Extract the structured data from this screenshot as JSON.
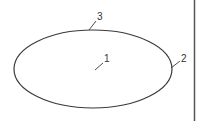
{
  "diagram": {
    "shape": "ellipse",
    "stroke_color": "#3a3a3a",
    "border_line_color": "#555555",
    "labels": [
      {
        "id": "1",
        "text": "1",
        "refers_to": "interior"
      },
      {
        "id": "2",
        "text": "2",
        "refers_to": "right edge"
      },
      {
        "id": "3",
        "text": "3",
        "refers_to": "top edge"
      }
    ]
  }
}
